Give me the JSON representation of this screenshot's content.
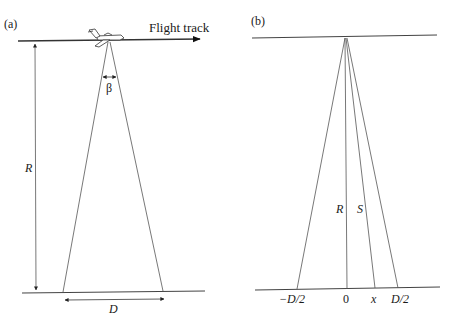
{
  "panels": {
    "a": {
      "label": "(a)",
      "flight_track_label": "Flight track",
      "beam_angle_label": "β",
      "range_label": "R",
      "swath_label": "D"
    },
    "b": {
      "label": "(b)",
      "range_label": "R",
      "slant_label": "S",
      "ticks": [
        "−D/2",
        "0",
        "x",
        "D/2"
      ]
    }
  },
  "colors": {
    "line": "#333333",
    "background": "#ffffff"
  }
}
